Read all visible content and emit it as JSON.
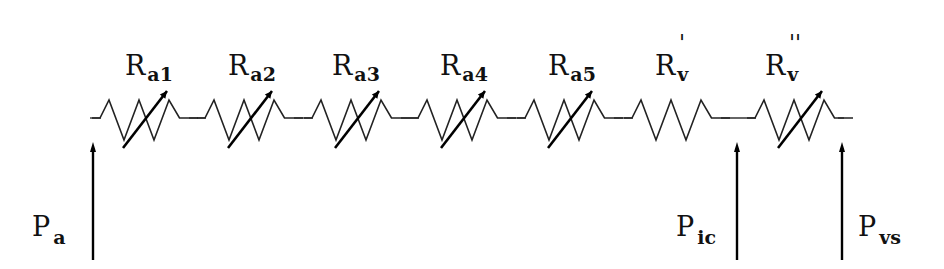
{
  "diagram": {
    "resistors": [
      {
        "label": "R",
        "sub": "a1",
        "prime": "",
        "variable": true
      },
      {
        "label": "R",
        "sub": "a2",
        "prime": "",
        "variable": true
      },
      {
        "label": "R",
        "sub": "a3",
        "prime": "",
        "variable": true
      },
      {
        "label": "R",
        "sub": "a4",
        "prime": "",
        "variable": true
      },
      {
        "label": "R",
        "sub": "a5",
        "prime": "",
        "variable": true
      },
      {
        "label": "R",
        "sub": "v",
        "prime": "'",
        "variable": false
      },
      {
        "label": "R",
        "sub": "v",
        "prime": "''",
        "variable": true
      }
    ],
    "pressures": [
      {
        "label": "P",
        "sub": "a",
        "side": "left"
      },
      {
        "label": "P",
        "sub": "ic",
        "side": "left"
      },
      {
        "label": "P",
        "sub": "vs",
        "side": "right"
      }
    ]
  }
}
